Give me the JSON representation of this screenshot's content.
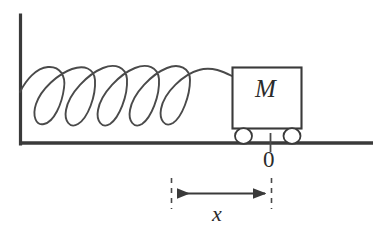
{
  "figure": {
    "colors": {
      "background": "#ffffff",
      "ink": "#3a3a3a",
      "heavy_ink": "#2b2b2b",
      "label": "#2b2b2b"
    }
  },
  "labels": {
    "mass": "M",
    "origin": "0",
    "displacement": "x"
  },
  "elements": {
    "wall_name": "wall",
    "ground_name": "ground-line",
    "spring_name": "coil-spring",
    "block_name": "mass-block",
    "wheel_left_name": "wheel-left",
    "wheel_right_name": "wheel-right",
    "origin_tick_name": "origin-tick",
    "arrow_name": "displacement-arrow",
    "guide_left_name": "guide-line-left",
    "guide_right_name": "guide-line-right"
  },
  "geometry": {
    "canvas": {
      "width": 379,
      "height": 239
    },
    "wall": {
      "x": 20,
      "y_top": 15,
      "y_bottom": 144
    },
    "ground": {
      "y": 143,
      "x_left": 20,
      "x_right": 373
    },
    "spring": {
      "x_start": 20,
      "x_end": 232,
      "y_axis": 92,
      "coils": 5
    },
    "block": {
      "x": 232,
      "y": 67,
      "width": 70,
      "height": 62
    },
    "wheels": {
      "left_cx": 243,
      "right_cx": 292,
      "cy": 136,
      "rx": 9,
      "ry": 8
    },
    "origin": {
      "x": 270
    },
    "dimension": {
      "x_left": 171,
      "x_right": 271,
      "y": 193
    }
  }
}
